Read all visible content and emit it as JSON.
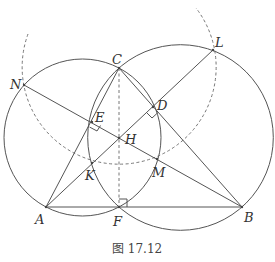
{
  "figure": {
    "caption": "图 17.12",
    "points": {
      "A": {
        "label": "A",
        "x": 46,
        "y": 207
      },
      "B": {
        "label": "B",
        "x": 242,
        "y": 207
      },
      "C": {
        "label": "C",
        "x": 119,
        "y": 68
      },
      "D": {
        "label": "D",
        "x": 153,
        "y": 107
      },
      "E": {
        "label": "E",
        "x": 92,
        "y": 122
      },
      "F": {
        "label": "F",
        "x": 119,
        "y": 207
      },
      "H": {
        "label": "H",
        "x": 119,
        "y": 138
      },
      "K": {
        "label": "K",
        "x": 92,
        "y": 163
      },
      "M": {
        "label": "M",
        "x": 157,
        "y": 159
      },
      "N": {
        "label": "N",
        "x": 24,
        "y": 85
      },
      "L": {
        "label": "L",
        "x": 213,
        "y": 50
      }
    },
    "circles": [
      {
        "name": "circle-ACF",
        "cx": 82.5,
        "cy": 137.5,
        "r": 78.5,
        "style": "solid"
      },
      {
        "name": "circle-BCF",
        "cx": 180.5,
        "cy": 137.5,
        "r": 92.8,
        "style": "solid"
      },
      {
        "name": "circle-C-dashed",
        "cx": 119,
        "cy": 68,
        "r": 97,
        "style": "dashed"
      }
    ],
    "segments": [
      "AB",
      "AC",
      "BC",
      "AL",
      "BN",
      "CF(dashed)"
    ],
    "right_angles": [
      "E",
      "D",
      "F"
    ]
  }
}
